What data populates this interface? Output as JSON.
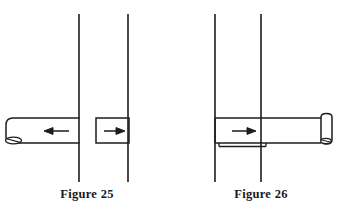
{
  "page": {
    "background_color": "#ffffff",
    "ink_color": "#1d1d1d",
    "width": 348,
    "height": 213,
    "document_type": "technical-illustration"
  },
  "figures": [
    {
      "id": "figure-25",
      "caption": "Figure 25",
      "description": "Bolt shown withdrawn: shank on the left side of the gap, separate block on the right side of the gap",
      "plates": {
        "count": 2,
        "orientation": "vertical",
        "left_line_x": 79,
        "right_line_x": 128,
        "top_y": 14,
        "bottom_y": 182
      },
      "parts": [
        {
          "name": "bolt-shank-left",
          "shape": "rounded-end-bar",
          "x": 6,
          "y": 118,
          "width": 74,
          "height": 25,
          "arrow": {
            "name": "arrow-left",
            "direction": "left",
            "x": 44,
            "y": 131,
            "length": 24
          },
          "end_cap": {
            "name": "bolt-head-oval",
            "cx": 13,
            "cy": 140,
            "rx": 8,
            "ry": 3.5
          }
        },
        {
          "name": "bolt-block-right",
          "shape": "rectangle",
          "x": 96,
          "y": 118,
          "width": 33,
          "height": 25,
          "arrow": {
            "name": "arrow-right",
            "direction": "right",
            "x": 105,
            "y": 131,
            "length": 20
          }
        }
      ]
    },
    {
      "id": "figure-26",
      "caption": "Figure 26",
      "description": "Bolt shown engaged: a single continuous shank passing through both plates, with a slot line beneath and a cylindrical cap at the right end",
      "plates": {
        "count": 2,
        "orientation": "vertical",
        "left_line_x": 41,
        "right_line_x": 87,
        "top_y": 14,
        "bottom_y": 182
      },
      "parts": [
        {
          "name": "bolt-shank-through",
          "shape": "bar",
          "x": 41,
          "y": 118,
          "width": 104,
          "height": 25,
          "arrow": {
            "name": "arrow-right",
            "direction": "right",
            "x": 60,
            "y": 131,
            "length": 22
          },
          "slot": {
            "name": "slot-line",
            "x1": 45,
            "x2": 92,
            "y": 146
          },
          "end_cap": {
            "name": "cylinder-end-cap",
            "x": 145,
            "y": 117,
            "width": 13,
            "height": 27,
            "oval": {
              "cx": 152,
              "cy": 141,
              "rx": 5,
              "ry": 2.5
            }
          }
        }
      ]
    }
  ]
}
